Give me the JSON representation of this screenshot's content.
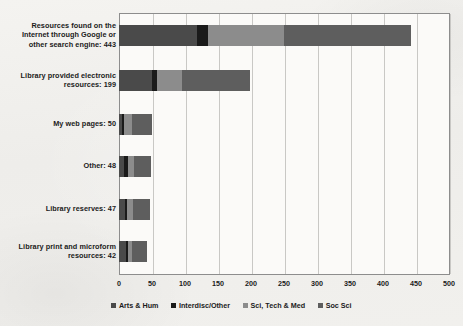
{
  "chart_data": {
    "type": "bar",
    "orientation": "horizontal",
    "stacked": true,
    "title": "",
    "subtitle": "",
    "xlabel": "",
    "ylabel": "",
    "xlim": [
      0,
      500
    ],
    "xticks": [
      0,
      50,
      100,
      150,
      200,
      250,
      300,
      350,
      400,
      450,
      500
    ],
    "grid": true,
    "legend_position": "bottom",
    "categories": [
      "Resources found on the Internet through Google or other search engine: 443",
      "Library provided electronic resources: 199",
      "My web pages: 50",
      "Other: 48",
      "Library reserves: 47",
      "Library print and microform resources: 42"
    ],
    "category_totals": [
      443,
      199,
      50,
      48,
      47,
      42
    ],
    "series": [
      {
        "name": "Arts & Hum",
        "color": "#4a4a4a",
        "values": [
          118,
          50,
          4,
          8,
          9,
          10
        ]
      },
      {
        "name": "Interdisc/Other",
        "color": "#1a1a1a",
        "values": [
          17,
          7,
          3,
          5,
          3,
          3
        ]
      },
      {
        "name": "Sci, Tech & Med",
        "color": "#8c8c8c",
        "values": [
          115,
          38,
          13,
          9,
          9,
          7
        ]
      },
      {
        "name": "Soc Sci",
        "color": "#5e5e5e",
        "values": [
          193,
          104,
          30,
          26,
          26,
          22
        ]
      }
    ]
  },
  "legend": {
    "items": [
      {
        "label": "Arts & Hum",
        "color": "#4a4a4a"
      },
      {
        "label": "Interdisc/Other",
        "color": "#1a1a1a"
      },
      {
        "label": "Sci, Tech & Med",
        "color": "#8c8c8c"
      },
      {
        "label": "Soc Sci",
        "color": "#5e5e5e"
      }
    ]
  },
  "axis": {
    "tick_labels": [
      "0",
      "50",
      "100",
      "150",
      "200",
      "250",
      "300",
      "350",
      "400",
      "450",
      "500"
    ]
  },
  "colors": {
    "plot_background": "#fbfaf8",
    "page_background": "#f2f1ee",
    "frame": "#8d8d8d",
    "gridline": "#c9c8c5",
    "text": "#1b1b1b"
  }
}
